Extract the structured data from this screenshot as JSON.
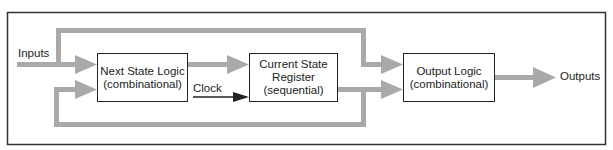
{
  "diagram": {
    "type": "finite-state-machine-block-diagram",
    "colors": {
      "frame": "#333333",
      "bus": "#a9a9a9",
      "box_border": "#222222",
      "clock": "#222222"
    },
    "inputs_label": "Inputs",
    "outputs_label": "Outputs",
    "clock_label": "Clock",
    "blocks": [
      {
        "id": "next_state",
        "line1": "Next State Logic",
        "line2": "(combinational)"
      },
      {
        "id": "current_state",
        "line1": "Current State",
        "line2": "Register",
        "line3": "(sequential)"
      },
      {
        "id": "output_logic",
        "line1": "Output Logic",
        "line2": "(combinational)"
      }
    ],
    "edges": [
      {
        "from": "Inputs",
        "to": "Next State Logic"
      },
      {
        "from": "Inputs",
        "to": "Output Logic"
      },
      {
        "from": "Next State Logic",
        "to": "Current State Register"
      },
      {
        "from": "Clock",
        "to": "Current State Register"
      },
      {
        "from": "Current State Register",
        "to": "Output Logic"
      },
      {
        "from": "Current State Register",
        "to": "Next State Logic"
      },
      {
        "from": "Output Logic",
        "to": "Outputs"
      }
    ]
  }
}
